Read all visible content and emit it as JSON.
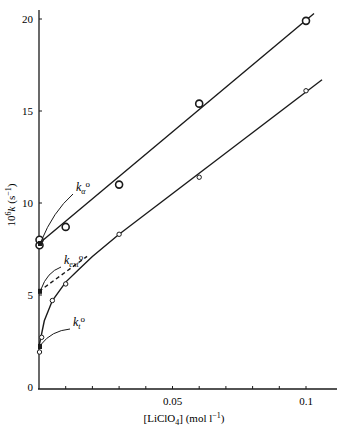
{
  "chart_data": {
    "type": "scatter",
    "title": "",
    "xlabel": "[LiClO4] (mol l-1)",
    "xlabel_parts": {
      "main": "[LiClO",
      "sub": "4",
      "rest": "] (mol l",
      "sup": "−1",
      "end": ")"
    },
    "ylabel": "10^6 k (s^-1)",
    "ylabel_parts": {
      "pre": "10",
      "sup": "6",
      "var": "k",
      "unit": " (s",
      "unit_sup": "−1",
      "end": ")"
    },
    "xlim": [
      0,
      0.11
    ],
    "ylim": [
      0,
      21
    ],
    "x_ticks": [
      0.01,
      0.02,
      0.03,
      0.04,
      0.05,
      0.06,
      0.07,
      0.08,
      0.09,
      0.1
    ],
    "x_tick_labels": [
      {
        "value": 0.05,
        "label": "0.05"
      },
      {
        "value": 0.1,
        "label": "0.1"
      }
    ],
    "y_ticks": [
      {
        "value": 0,
        "label": "0"
      },
      {
        "value": 5,
        "label": "5"
      },
      {
        "value": 10,
        "label": "10"
      },
      {
        "value": 15,
        "label": "15"
      },
      {
        "value": 20,
        "label": "20"
      }
    ],
    "grid": false,
    "legend": "none",
    "series": [
      {
        "name": "upper (k_alpha)",
        "marker": "large-open-circle",
        "points": [
          [
            0,
            7.7
          ],
          [
            0,
            8.0
          ],
          [
            0.01,
            8.7
          ],
          [
            0.03,
            11.0
          ],
          [
            0.06,
            15.4
          ],
          [
            0.1,
            19.9
          ]
        ],
        "fit": {
          "type": "line",
          "x": [
            0,
            0.103
          ],
          "y": [
            7.8,
            20.3
          ]
        }
      },
      {
        "name": "lower (k_t)",
        "marker": "small-open-circle",
        "points": [
          [
            0,
            1.9
          ],
          [
            0.001,
            2.7
          ],
          [
            0.005,
            4.7
          ],
          [
            0.01,
            5.6
          ],
          [
            0.03,
            8.3
          ],
          [
            0.06,
            11.4
          ],
          [
            0.1,
            16.1
          ]
        ],
        "fit": {
          "type": "curve+line",
          "curve": [
            [
              0,
              2.2
            ],
            [
              0.002,
              3.6
            ],
            [
              0.005,
              4.7
            ],
            [
              0.01,
              5.7
            ],
            [
              0.015,
              6.4
            ],
            [
              0.02,
              7.1
            ],
            [
              0.03,
              8.3
            ]
          ],
          "line": {
            "x": [
              0.03,
              0.106
            ],
            "y": [
              8.3,
              16.7
            ]
          }
        }
      },
      {
        "name": "k_ext extrapolation",
        "style": "dashed",
        "points": [
          [
            0,
            5.2
          ],
          [
            0.018,
            7.1
          ]
        ]
      }
    ],
    "annotations": [
      {
        "text": "kα°",
        "base": "k",
        "sub": "α",
        "sup": "o",
        "target": [
          0,
          7.8
        ],
        "label_pos_px": [
          76,
          191
        ]
      },
      {
        "text": "k_ext°",
        "base": "k",
        "sub": "ext",
        "sup": "o",
        "target": [
          0,
          5.2
        ],
        "label_pos_px": [
          64,
          264
        ]
      },
      {
        "text": "k_t°",
        "base": "k",
        "sub": "t",
        "sup": "o",
        "target": [
          0,
          2.2
        ],
        "label_pos_px": [
          73,
          326
        ]
      }
    ],
    "special_points": [
      {
        "name": "k_alpha0",
        "x": 0,
        "y": 7.8,
        "marker": "filled-dot"
      },
      {
        "name": "k_ext0",
        "x": 0,
        "y": 5.2,
        "marker": "filled-dot"
      },
      {
        "name": "k_t0",
        "x": 0,
        "y": 2.2,
        "marker": "filled-dot"
      }
    ]
  }
}
